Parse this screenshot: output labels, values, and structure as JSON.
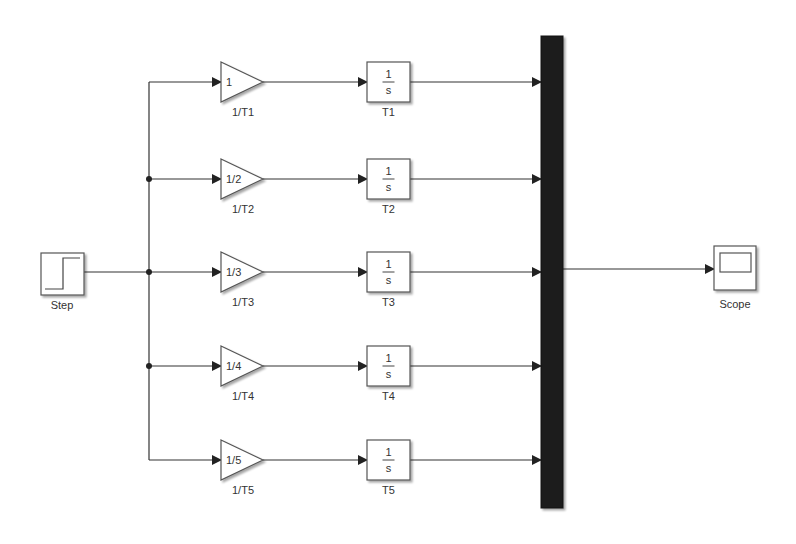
{
  "diagram": {
    "type": "simulink-model",
    "blocks": {
      "step": {
        "label": "Step",
        "kind": "step-source"
      },
      "mux": {
        "label": "",
        "kind": "mux",
        "inputs": 5
      },
      "scope": {
        "label": "Scope",
        "kind": "scope-sink"
      }
    },
    "branches": [
      {
        "gain": {
          "value": "1",
          "label": "1/T1"
        },
        "integrator": {
          "numerator": "1",
          "denominator": "s",
          "label": "T1"
        }
      },
      {
        "gain": {
          "value": "1/2",
          "label": "1/T2"
        },
        "integrator": {
          "numerator": "1",
          "denominator": "s",
          "label": "T2"
        }
      },
      {
        "gain": {
          "value": "1/3",
          "label": "1/T3"
        },
        "integrator": {
          "numerator": "1",
          "denominator": "s",
          "label": "T3"
        }
      },
      {
        "gain": {
          "value": "1/4",
          "label": "1/T4"
        },
        "integrator": {
          "numerator": "1",
          "denominator": "s",
          "label": "T4"
        }
      },
      {
        "gain": {
          "value": "1/5",
          "label": "1/T5"
        },
        "integrator": {
          "numerator": "1",
          "denominator": "s",
          "label": "T5"
        }
      }
    ],
    "connections": [
      "Step -> 1/T1",
      "Step -> 1/T2",
      "Step -> 1/T3",
      "Step -> 1/T4",
      "Step -> 1/T5",
      "1/T1 -> T1",
      "1/T2 -> T2",
      "1/T3 -> T3",
      "1/T4 -> T4",
      "1/T5 -> T5",
      "T1 -> Mux",
      "T2 -> Mux",
      "T3 -> Mux",
      "T4 -> Mux",
      "T5 -> Mux",
      "Mux -> Scope"
    ],
    "colors": {
      "line": "#333333",
      "block_border": "#555555",
      "mux_fill": "#1a1a1a",
      "background": "#ffffff"
    }
  }
}
